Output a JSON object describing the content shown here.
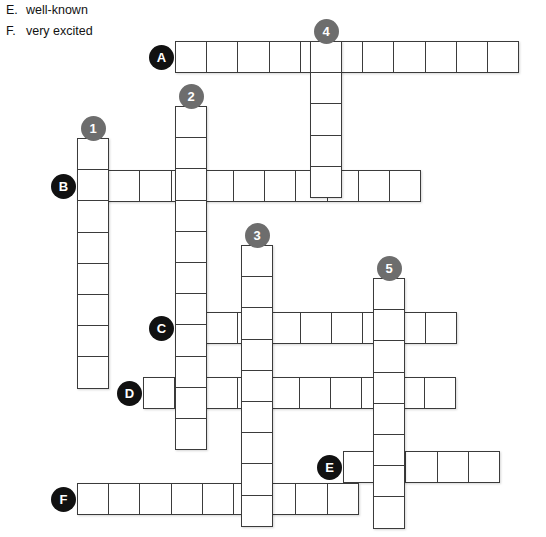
{
  "clues": [
    {
      "letter": "E.",
      "text": "well-known"
    },
    {
      "letter": "F.",
      "text": "very excited"
    }
  ],
  "colors": {
    "letter_marker": "#111111",
    "number_marker": "#6d6d6d",
    "cell_border": "#3b3b3b",
    "cell_fill": "#ffffff",
    "page_background": "#ffffff",
    "text": "#121212"
  },
  "grid": {
    "cell_size": 32.2,
    "origin_x": 77,
    "origin_y": 41
  },
  "entries": [
    {
      "name": "word-a-across",
      "marker": "A",
      "marker_type": "letter",
      "direction": "across",
      "length": 11,
      "x": 175,
      "y": 41
    },
    {
      "name": "word-b-across",
      "marker": "B",
      "marker_type": "letter",
      "direction": "across",
      "length": 11,
      "x": 77,
      "y": 170
    },
    {
      "name": "word-c-across",
      "marker": "C",
      "marker_type": "letter",
      "direction": "across",
      "length": 9,
      "x": 175,
      "y": 312
    },
    {
      "name": "word-d-across",
      "marker": "D",
      "marker_type": "letter",
      "direction": "across",
      "length": 10,
      "x": 143,
      "y": 377
    },
    {
      "name": "word-e-across",
      "marker": "E",
      "marker_type": "letter",
      "direction": "across",
      "length": 5,
      "x": 343,
      "y": 451
    },
    {
      "name": "word-f-across",
      "marker": "F",
      "marker_type": "letter",
      "direction": "across",
      "length": 9,
      "x": 77,
      "y": 483
    },
    {
      "name": "word-1-down",
      "marker": "1",
      "marker_type": "number",
      "direction": "down",
      "length": 8,
      "x": 77,
      "y": 138
    },
    {
      "name": "word-2-down",
      "marker": "2",
      "marker_type": "number",
      "direction": "down",
      "length": 11,
      "x": 175,
      "y": 106
    },
    {
      "name": "word-3-down",
      "marker": "3",
      "marker_type": "number",
      "direction": "down",
      "length": 9,
      "x": 241,
      "y": 245
    },
    {
      "name": "word-4-down",
      "marker": "4",
      "marker_type": "number",
      "direction": "down",
      "length": 5,
      "x": 310,
      "y": 41
    },
    {
      "name": "word-5-down",
      "marker": "5",
      "marker_type": "number",
      "direction": "down",
      "length": 8,
      "x": 373,
      "y": 278
    }
  ]
}
